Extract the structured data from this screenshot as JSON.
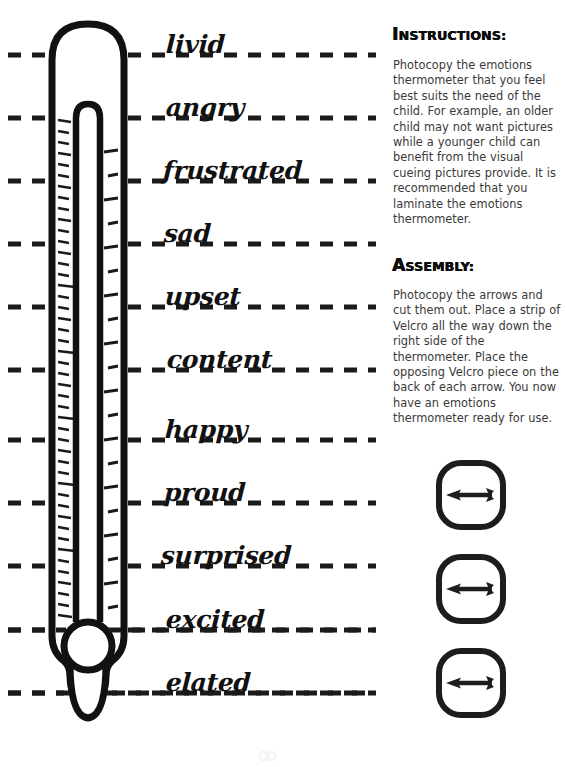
{
  "document": {
    "title": "Emotions Thermometer",
    "background_color": "#ffffff",
    "ink_color": "#111111"
  },
  "thermometer": {
    "name": "emotions-thermometer",
    "scale_line_style": "dashed",
    "scale_line_color": "#1a1a1a",
    "levels": [
      {
        "label": "livid",
        "line_y": 55,
        "label_x": 166,
        "label_y": 47
      },
      {
        "label": "angry",
        "line_y": 118,
        "label_x": 166,
        "label_y": 110
      },
      {
        "label": "frustrated",
        "line_y": 181,
        "label_x": 163,
        "label_y": 173
      },
      {
        "label": "sad",
        "line_y": 244,
        "label_x": 164,
        "label_y": 236
      },
      {
        "label": "upset",
        "line_y": 307,
        "label_x": 165,
        "label_y": 299
      },
      {
        "label": "content",
        "line_y": 370,
        "label_x": 167,
        "label_y": 362
      },
      {
        "label": "happy",
        "line_y": 440,
        "label_x": 165,
        "label_y": 431
      },
      {
        "label": "proud",
        "line_y": 503,
        "label_x": 164,
        "label_y": 494
      },
      {
        "label": "surprised",
        "line_y": 566,
        "label_x": 161,
        "label_y": 557
      },
      {
        "label": "excited",
        "line_y": 630,
        "label_x": 166,
        "label_y": 621
      },
      {
        "label": "elated",
        "line_y": 693,
        "label_x": 166,
        "label_y": 684
      }
    ]
  },
  "instructions": {
    "heading": "INSTRUCTIONS:",
    "heading_parts": {
      "lead": "I",
      "rest": "NSTRUCTIONS:"
    },
    "body": "Photocopy the emotions thermometer that you feel best suits the need of the child. For example, an older child may not want pictures while a younger child can benefit from the visual cueing pictures provide. It is recommended that you laminate the emotions thermometer."
  },
  "assembly": {
    "heading": "ASSEMBLY:",
    "heading_parts": {
      "lead": "A",
      "rest": "SSEMBLY:"
    },
    "body": "Photocopy the arrows and cut them out. Place a strip of Velcro all the way down the right side of the thermometer. Place the opposing Velcro piece on the back of each arrow. You now have an emotions thermometer ready for use."
  },
  "arrow_cards": [
    {
      "name": "arrow-card-1",
      "top": 458,
      "direction": "left"
    },
    {
      "name": "arrow-card-2",
      "top": 552,
      "direction": "left"
    },
    {
      "name": "arrow-card-3",
      "top": 646,
      "direction": "left"
    }
  ],
  "artifact": {
    "text": "oo"
  }
}
